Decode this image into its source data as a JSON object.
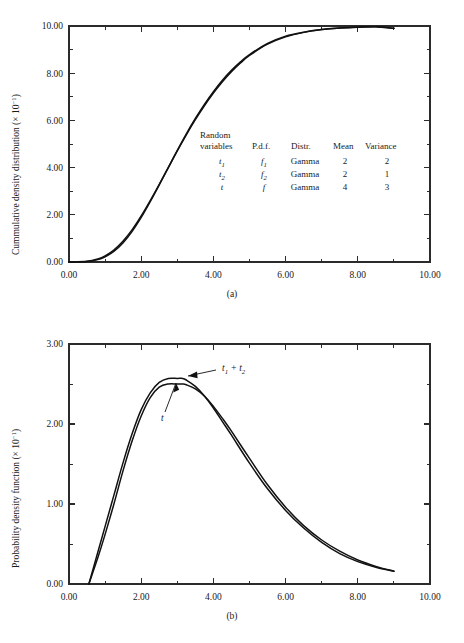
{
  "figure": {
    "panels": [
      {
        "id": "a",
        "caption": "(a)",
        "ylabel_main": "Cummulative density distribution (× 10",
        "ylabel_exp": "−1",
        "ylabel_close": ")",
        "xlabel": ""
      },
      {
        "id": "b",
        "caption": "(b)",
        "ylabel_main": "Probability density function (× 10",
        "ylabel_exp": "−1",
        "ylabel_close": ")",
        "xlabel": ""
      }
    ],
    "legend": {
      "headers": {
        "col1_line1": "Random",
        "col1_line2": "variables",
        "col2": "P.d.f.",
        "col3": "Distr.",
        "col4": "Mean",
        "col5": "Variance"
      },
      "rows": [
        {
          "variable": "t",
          "variable_sub": "1",
          "pdf": "f",
          "pdf_sub": "1",
          "distr": "Gamma",
          "mean": "2",
          "variance": "2"
        },
        {
          "variable": "t",
          "variable_sub": "2",
          "pdf": "f",
          "pdf_sub": "2",
          "distr": "Gamma",
          "mean": "2",
          "variance": "1"
        },
        {
          "variable": "t",
          "variable_sub": "",
          "pdf": "f",
          "pdf_sub": "",
          "distr": "Gamma",
          "mean": "4",
          "variance": "3"
        }
      ]
    },
    "annotations": [
      {
        "id": "sum",
        "text": "t",
        "sub1": "1",
        "plus": " + ",
        "text2": "t",
        "sub2": "2"
      },
      {
        "id": "t",
        "text": "t"
      }
    ]
  },
  "chart_data": [
    {
      "type": "line",
      "panel": "a",
      "title": "",
      "xlabel": "",
      "ylabel": "Cummulative density distribution (× 10⁻¹)",
      "xlim": [
        0,
        10
      ],
      "ylim": [
        0,
        10
      ],
      "xticks": [
        "0.00",
        "2.00",
        "4.00",
        "6.00",
        "8.00",
        "10.00"
      ],
      "xtick_values": [
        0,
        2,
        4,
        6,
        8,
        10
      ],
      "xminor_values": [
        1,
        3,
        5,
        7,
        9
      ],
      "yticks": [
        "0.00",
        "2.00",
        "4.00",
        "6.00",
        "8.00",
        "10.00"
      ],
      "ytick_values": [
        0,
        2,
        4,
        6,
        8,
        10
      ],
      "yminor_values": [
        1,
        3,
        5,
        7,
        9
      ],
      "grid": false,
      "legend_position": "inside-center-right",
      "series": [
        {
          "name": "t1 + t2 (convolution CDF)",
          "x": [
            0.0,
            0.5,
            0.8,
            1.0,
            1.25,
            1.5,
            1.75,
            2.0,
            2.25,
            2.5,
            2.75,
            3.0,
            3.25,
            3.5,
            3.75,
            4.0,
            4.25,
            4.5,
            4.75,
            5.0,
            5.5,
            6.0,
            6.5,
            7.0,
            7.5,
            8.0,
            8.5,
            9.0
          ],
          "y": [
            0.0,
            0.03,
            0.13,
            0.26,
            0.52,
            0.89,
            1.37,
            1.95,
            2.6,
            3.29,
            4.0,
            4.71,
            5.39,
            6.03,
            6.62,
            7.16,
            7.64,
            8.06,
            8.43,
            8.75,
            9.23,
            9.54,
            9.73,
            9.85,
            9.91,
            9.95,
            9.97,
            9.9
          ]
        },
        {
          "name": "t (Gamma mean 4, variance 3)",
          "x": [
            0.0,
            0.5,
            0.8,
            1.0,
            1.25,
            1.5,
            1.75,
            2.0,
            2.25,
            2.5,
            2.75,
            3.0,
            3.25,
            3.5,
            3.75,
            4.0,
            4.25,
            4.5,
            4.75,
            5.0,
            5.5,
            6.0,
            6.5,
            7.0,
            7.5,
            8.0,
            8.5,
            9.0
          ],
          "y": [
            0.0,
            0.02,
            0.1,
            0.22,
            0.46,
            0.82,
            1.3,
            1.89,
            2.56,
            3.27,
            4.0,
            4.73,
            5.43,
            6.08,
            6.68,
            7.22,
            7.7,
            8.12,
            8.48,
            8.79,
            9.26,
            9.57,
            9.74,
            9.85,
            9.92,
            9.95,
            9.97,
            9.9
          ]
        }
      ]
    },
    {
      "type": "line",
      "panel": "b",
      "title": "",
      "xlabel": "",
      "ylabel": "Probability density function (× 10⁻¹)",
      "xlim": [
        0,
        10
      ],
      "ylim": [
        0,
        3
      ],
      "xticks": [
        "0.00",
        "2.00",
        "4.00",
        "6.00",
        "8.00",
        "10.00"
      ],
      "xtick_values": [
        0,
        2,
        4,
        6,
        8,
        10
      ],
      "xminor_values": [
        1,
        3,
        5,
        7,
        9
      ],
      "yticks": [
        "0.00",
        "1.00",
        "2.00",
        "3.00"
      ],
      "ytick_values": [
        0,
        1,
        2,
        3
      ],
      "yminor_values": [
        0.5,
        1.5,
        2.5
      ],
      "grid": false,
      "legend_position": "none",
      "series": [
        {
          "name": "t1 + t2",
          "peak_x": 3.15,
          "peak_y": 2.57,
          "x": [
            0.55,
            0.8,
            1.0,
            1.25,
            1.5,
            1.75,
            2.0,
            2.25,
            2.5,
            2.75,
            3.0,
            3.15,
            3.25,
            3.5,
            3.75,
            4.0,
            4.25,
            4.5,
            5.0,
            5.5,
            6.0,
            6.5,
            7.0,
            7.5,
            8.0,
            8.5,
            9.0
          ],
          "y": [
            0.0,
            0.4,
            0.72,
            1.12,
            1.52,
            1.88,
            2.18,
            2.39,
            2.52,
            2.57,
            2.57,
            2.57,
            2.55,
            2.47,
            2.35,
            2.2,
            2.03,
            1.86,
            1.51,
            1.19,
            0.92,
            0.7,
            0.52,
            0.38,
            0.28,
            0.21,
            0.16
          ]
        },
        {
          "name": "t",
          "peak_x": 3.15,
          "peak_y": 2.5,
          "x": [
            0.55,
            0.8,
            1.0,
            1.25,
            1.5,
            1.75,
            2.0,
            2.25,
            2.5,
            2.75,
            3.0,
            3.15,
            3.25,
            3.5,
            3.75,
            4.0,
            4.25,
            4.5,
            5.0,
            5.5,
            6.0,
            6.5,
            7.0,
            7.5,
            8.0,
            8.5,
            9.0
          ],
          "y": [
            0.0,
            0.33,
            0.62,
            1.01,
            1.42,
            1.79,
            2.1,
            2.33,
            2.46,
            2.5,
            2.5,
            2.5,
            2.49,
            2.44,
            2.35,
            2.22,
            2.07,
            1.91,
            1.57,
            1.24,
            0.96,
            0.73,
            0.55,
            0.41,
            0.3,
            0.22,
            0.16
          ]
        }
      ]
    }
  ]
}
